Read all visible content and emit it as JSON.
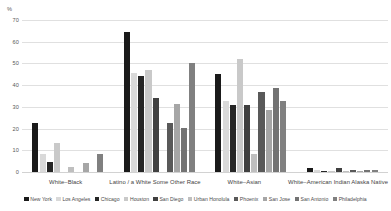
{
  "chart_data": {
    "type": "bar",
    "title": "",
    "subtitle": "",
    "xlabel": "",
    "ylabel": "%",
    "ylim": [
      0,
      70
    ],
    "yticks": [
      0,
      10,
      20,
      30,
      40,
      50,
      60,
      70
    ],
    "grid": true,
    "legend_position": "bottom",
    "orientation": "vertical",
    "grouping": "clustered",
    "categories": [
      "White–Black",
      "Latino / a White Some Other Race",
      "White–Asian",
      "White–American Indian Alaska Native"
    ],
    "series": [
      {
        "name": "New York",
        "color": "#1a1a1a",
        "values": [
          22.5,
          64.5,
          45.0,
          1.8
        ]
      },
      {
        "name": "Los Angeles",
        "color": "#d9d9d9",
        "values": [
          8.5,
          45.5,
          32.5,
          0.8
        ]
      },
      {
        "name": "Chicago",
        "color": "#262626",
        "values": [
          4.5,
          44.0,
          31.0,
          0.4
        ]
      },
      {
        "name": "Houston",
        "color": "#c9c9c9",
        "values": [
          13.5,
          47.0,
          52.0,
          0.5
        ]
      },
      {
        "name": "San Diego",
        "color": "#404040",
        "values": [
          0.0,
          34.0,
          31.0,
          1.7
        ]
      },
      {
        "name": "Urban Honolula",
        "color": "#bfbfbf",
        "values": [
          2.5,
          0.0,
          8.5,
          0.4
        ]
      },
      {
        "name": "Phoenix",
        "color": "#595959",
        "values": [
          0.0,
          22.5,
          37.0,
          0.9
        ]
      },
      {
        "name": "San Jose",
        "color": "#a6a6a6",
        "values": [
          4.0,
          31.5,
          28.5,
          0.5
        ]
      },
      {
        "name": "San Antonio",
        "color": "#737373",
        "values": [
          0.0,
          20.5,
          38.5,
          1.0
        ]
      },
      {
        "name": "Philadelphia",
        "color": "#808080",
        "values": [
          8.5,
          50.0,
          32.5,
          1.0
        ]
      }
    ]
  },
  "axis": {
    "unit_label": "%",
    "tick_labels": [
      "70",
      "60",
      "50",
      "40",
      "30",
      "20",
      "10",
      "0"
    ]
  }
}
